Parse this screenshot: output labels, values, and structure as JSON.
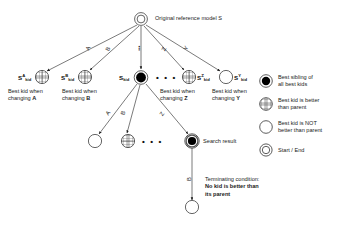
{
  "diagram": {
    "title_note": "Original reference model S",
    "root": {
      "name": "root-node",
      "shape": "double-circle",
      "label": ""
    },
    "level1_edge_labels": [
      "A",
      "B",
      "•••",
      "Z",
      "Y"
    ],
    "level1_nodes": [
      {
        "id": "s-a-kid",
        "shape": "grid-circle",
        "base": "S",
        "sup": "A",
        "sub": "kid",
        "caption_line1": "Best kid when",
        "caption_line2": "changing A",
        "caption_bold_tail": "A"
      },
      {
        "id": "s-b-kid",
        "shape": "grid-circle",
        "base": "S",
        "sup": "B",
        "sub": "kid",
        "caption_line1": "Best kid when",
        "caption_line2": "changing B",
        "caption_bold_tail": "B"
      },
      {
        "id": "s-kid-best",
        "shape": "filled-circle",
        "base": "S",
        "sup": "",
        "sub": "kid",
        "caption_line1": "",
        "caption_line2": "",
        "caption_bold_tail": ""
      },
      {
        "id": "s-z-kid",
        "shape": "grid-circle",
        "base": "S",
        "sup": "Z",
        "sub": "kid",
        "caption_line1": "Best kid when",
        "caption_line2": "changing Z",
        "caption_bold_tail": "Z"
      },
      {
        "id": "s-y-kid",
        "shape": "empty-circle",
        "base": "S",
        "sup": "Y",
        "sub": "kid",
        "caption_line1": "Best kid when",
        "caption_line2": "changing Y",
        "caption_bold_tail": "Y"
      }
    ],
    "level1_ellipsis": "• • •",
    "level2_edge_labels": [
      "A",
      "B",
      "Z"
    ],
    "level2_nodes": [
      {
        "id": "l2-empty",
        "shape": "empty-circle"
      },
      {
        "id": "l2-grid",
        "shape": "grid-circle"
      },
      {
        "id": "l2-result",
        "shape": "filled-double-circle"
      }
    ],
    "level2_ellipsis": "• • •",
    "search_result_label": "Search result",
    "terminating": {
      "line1": "Terminating condition:",
      "line2": "No kid is better than",
      "line3": "its parent"
    },
    "final_node": {
      "id": "final-node",
      "shape": "empty-circle"
    }
  },
  "legend": {
    "items": [
      {
        "shape": "filled-circle",
        "line1": "Best sibling of",
        "line2": "all best kids"
      },
      {
        "shape": "grid-circle",
        "line1": "Best kid is better",
        "line2": "than parent"
      },
      {
        "shape": "empty-circle",
        "line1": "Best kid is NOT",
        "line2": "better than parent"
      },
      {
        "shape": "double-circle",
        "line1": "Start / End",
        "line2": ""
      }
    ]
  },
  "colors": {
    "ink": "#1a1a1a",
    "line": "#333333",
    "fill": "#000000",
    "paper": "#ffffff"
  }
}
